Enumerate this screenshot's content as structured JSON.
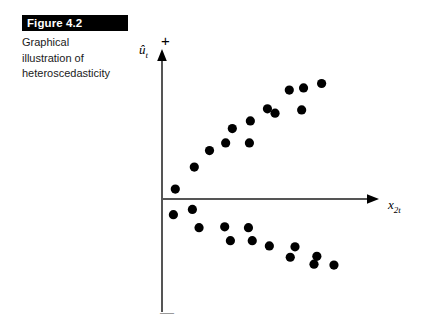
{
  "figure": {
    "banner_label": "Figure 4.2",
    "caption_lines": [
      "Graphical",
      "illustration of",
      "heteroscedasticity"
    ]
  },
  "axes": {
    "y_label": "û",
    "y_label_sub": "t",
    "x_label": "x",
    "x_label_sub": "2t",
    "positive_sign": "+",
    "negative_sign": "—"
  },
  "colors": {
    "background": "#ffffff",
    "ink": "#000000",
    "banner_bg": "#000000",
    "banner_text": "#ffffff",
    "axis": "#555555",
    "point": "#000000"
  },
  "chart_data": {
    "type": "scatter",
    "title": "Figure 4.2 Graphical illustration of heteroscedasticity",
    "xlabel": "x_2t",
    "ylabel": "u-hat_t",
    "grid": false,
    "legend": "none",
    "axis_style": "arrowed-crosshair",
    "xlim": [
      0,
      220
    ],
    "ylim": [
      -130,
      130
    ],
    "note": "Residual spread widens as x_2t increases (fanning / megaphone pattern)",
    "series": [
      {
        "name": "positive residuals",
        "points": [
          [
            14,
            9
          ],
          [
            34,
            29
          ],
          [
            50,
            44
          ],
          [
            67,
            51
          ],
          [
            74,
            64
          ],
          [
            92,
            51
          ],
          [
            93,
            71
          ],
          [
            111,
            82
          ],
          [
            119,
            78
          ],
          [
            134,
            99
          ],
          [
            147,
            81
          ],
          [
            149,
            101
          ],
          [
            168,
            105
          ]
        ]
      },
      {
        "name": "negative residuals",
        "points": [
          [
            12,
            -18
          ],
          [
            32,
            -12
          ],
          [
            39,
            -33
          ],
          [
            66,
            -32
          ],
          [
            72,
            -48
          ],
          [
            91,
            -33
          ],
          [
            95,
            -48
          ],
          [
            113,
            -54
          ],
          [
            135,
            -67
          ],
          [
            140,
            -55
          ],
          [
            163,
            -66
          ],
          [
            160,
            -75
          ],
          [
            181,
            -76
          ]
        ]
      }
    ]
  }
}
